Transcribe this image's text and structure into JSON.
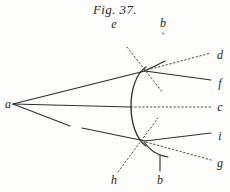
{
  "figure": {
    "title": "Fig. 37.",
    "caption_position": "top-center",
    "background_color": "#fdfdfb",
    "ink_color": "#2b2b2b",
    "width": 230,
    "height": 192
  },
  "labels": [
    {
      "id": "label-a",
      "text": "a",
      "x": 8,
      "y": 104
    },
    {
      "id": "label-e",
      "text": "e",
      "x": 114,
      "y": 24
    },
    {
      "id": "label-b-top",
      "text": "b",
      "x": 163,
      "y": 23
    },
    {
      "id": "label-d",
      "text": "d",
      "x": 220,
      "y": 55
    },
    {
      "id": "label-f",
      "text": "f",
      "x": 220,
      "y": 83
    },
    {
      "id": "label-c",
      "text": "c",
      "x": 220,
      "y": 107
    },
    {
      "id": "label-i",
      "text": "i",
      "x": 220,
      "y": 136
    },
    {
      "id": "label-g",
      "text": "g",
      "x": 220,
      "y": 163
    },
    {
      "id": "label-h",
      "text": "h",
      "x": 114,
      "y": 180
    },
    {
      "id": "label-b-bottom",
      "text": "b",
      "x": 160,
      "y": 180
    }
  ],
  "geometry": {
    "source_point": {
      "x": 13,
      "y": 104
    },
    "mirror_vertex": {
      "x": 130,
      "y": 107
    },
    "upper_incidence": {
      "x": 145,
      "y": 71
    },
    "lower_incidence": {
      "x": 145,
      "y": 141
    },
    "mirror_arc_top": {
      "x": 146,
      "y": 68
    },
    "mirror_arc_bottom": {
      "x": 146,
      "y": 145
    }
  },
  "strokes": {
    "solid_color": "#2e2e2e",
    "dotted_color": "#4a4a4a",
    "solid_width": 1.1,
    "dotted_width": 1.0,
    "dash_pattern": "1.5 2.4"
  }
}
